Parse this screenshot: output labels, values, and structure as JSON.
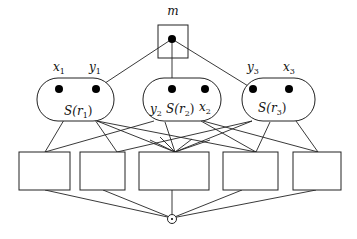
{
  "diagram": {
    "root": {
      "label": "m"
    },
    "groups": [
      {
        "id": "r1",
        "label_main": "S(r",
        "label_sub": "1",
        "label_close": ")",
        "points": [
          {
            "name": "x",
            "sub": "1"
          },
          {
            "name": "y",
            "sub": "1"
          }
        ]
      },
      {
        "id": "r2",
        "label_main": "S(r",
        "label_sub": "2",
        "label_close": ")",
        "points": [
          {
            "name": "y",
            "sub": "2"
          },
          {
            "name": "x",
            "sub": "2"
          }
        ]
      },
      {
        "id": "r3",
        "label_main": "S(r",
        "label_sub": "3",
        "label_close": ")",
        "points": [
          {
            "name": "y",
            "sub": "3"
          },
          {
            "name": "x",
            "sub": "3"
          }
        ]
      }
    ],
    "boxes": [
      {
        "id": "b1"
      },
      {
        "id": "b2"
      },
      {
        "id": "b3"
      },
      {
        "id": "b4"
      },
      {
        "id": "b5"
      }
    ],
    "sink": {
      "symbol": "⊙"
    },
    "edges_root_to_points": [
      "y1",
      "y2",
      "y3"
    ],
    "edges_groups_to_boxes": [
      [
        "r1",
        "b1"
      ],
      [
        "r1",
        "b2"
      ],
      [
        "r1",
        "b3"
      ],
      [
        "r1",
        "b4"
      ],
      [
        "r2",
        "b1"
      ],
      [
        "r2",
        "b3"
      ],
      [
        "r2",
        "b4"
      ],
      [
        "r2",
        "b5"
      ],
      [
        "r3",
        "b2"
      ],
      [
        "r3",
        "b3"
      ],
      [
        "r3",
        "b4"
      ],
      [
        "r3",
        "b5"
      ]
    ],
    "edges_boxes_to_sink": [
      "b1",
      "b2",
      "b3",
      "b4",
      "b5"
    ]
  }
}
